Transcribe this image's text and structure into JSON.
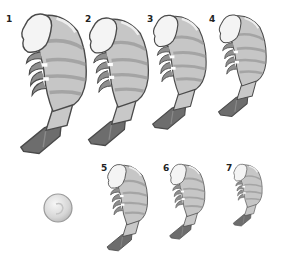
{
  "figure": {
    "colors": {
      "head": "#f4f4f4",
      "body_light": "#d2d2d2",
      "body_mid": "#bdbdbd",
      "body_dark": "#9d9d9d",
      "tail": "#6d6d6d",
      "outline": "#4a4a4a",
      "coin": "#d9d9d9"
    },
    "shrimps": [
      {
        "label": "1",
        "x": 18,
        "y": 10,
        "w": 70,
        "h": 147
      },
      {
        "label": "2",
        "x": 86,
        "y": 14,
        "w": 64,
        "h": 135
      },
      {
        "label": "3",
        "x": 150,
        "y": 12,
        "w": 58,
        "h": 120
      },
      {
        "label": "4",
        "x": 215,
        "y": 12,
        "w": 54,
        "h": 107
      },
      {
        "label": "5",
        "x": 105,
        "y": 162,
        "w": 44,
        "h": 91
      },
      {
        "label": "6",
        "x": 168,
        "y": 162,
        "w": 38,
        "h": 79
      },
      {
        "label": "7",
        "x": 232,
        "y": 162,
        "w": 31,
        "h": 66
      }
    ],
    "coin": {
      "cx": 58,
      "cy": 208,
      "r": 14
    }
  }
}
